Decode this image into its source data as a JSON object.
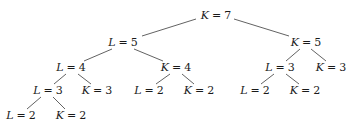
{
  "tree": {
    "nodes": [
      {
        "id": "n0",
        "var": "K",
        "value": "7",
        "x": 216,
        "y": 10
      },
      {
        "id": "n1",
        "var": "L",
        "value": "5",
        "x": 123,
        "y": 37
      },
      {
        "id": "n2",
        "var": "K",
        "value": "5",
        "x": 306,
        "y": 37
      },
      {
        "id": "n3",
        "var": "L",
        "value": "4",
        "x": 71,
        "y": 62
      },
      {
        "id": "n4",
        "var": "K",
        "value": "4",
        "x": 176,
        "y": 62
      },
      {
        "id": "n5",
        "var": "L",
        "value": "3",
        "x": 280,
        "y": 62
      },
      {
        "id": "n6",
        "var": "K",
        "value": "3",
        "x": 331,
        "y": 62
      },
      {
        "id": "n7",
        "var": "L",
        "value": "3",
        "x": 48,
        "y": 85
      },
      {
        "id": "n8",
        "var": "K",
        "value": "3",
        "x": 97,
        "y": 85
      },
      {
        "id": "n9",
        "var": "L",
        "value": "2",
        "x": 149,
        "y": 85
      },
      {
        "id": "n10",
        "var": "K",
        "value": "2",
        "x": 199,
        "y": 85
      },
      {
        "id": "n11",
        "var": "L",
        "value": "2",
        "x": 255,
        "y": 85
      },
      {
        "id": "n12",
        "var": "K",
        "value": "2",
        "x": 305,
        "y": 85
      },
      {
        "id": "n13",
        "var": "L",
        "value": "2",
        "x": 21,
        "y": 110
      },
      {
        "id": "n14",
        "var": "K",
        "value": "2",
        "x": 71,
        "y": 110
      }
    ],
    "edges": [
      {
        "x1": 196,
        "y1": 19,
        "x2": 142,
        "y2": 36
      },
      {
        "x1": 234,
        "y1": 19,
        "x2": 289,
        "y2": 36
      },
      {
        "x1": 112,
        "y1": 49,
        "x2": 84,
        "y2": 61
      },
      {
        "x1": 134,
        "y1": 49,
        "x2": 163,
        "y2": 61
      },
      {
        "x1": 300,
        "y1": 49,
        "x2": 286,
        "y2": 61
      },
      {
        "x1": 311,
        "y1": 49,
        "x2": 326,
        "y2": 61
      },
      {
        "x1": 66,
        "y1": 74,
        "x2": 54,
        "y2": 84
      },
      {
        "x1": 78,
        "y1": 74,
        "x2": 91,
        "y2": 84
      },
      {
        "x1": 170,
        "y1": 74,
        "x2": 156,
        "y2": 84
      },
      {
        "x1": 182,
        "y1": 74,
        "x2": 194,
        "y2": 84
      },
      {
        "x1": 274,
        "y1": 74,
        "x2": 261,
        "y2": 84
      },
      {
        "x1": 286,
        "y1": 74,
        "x2": 299,
        "y2": 84
      },
      {
        "x1": 41,
        "y1": 97,
        "x2": 27,
        "y2": 109
      },
      {
        "x1": 53,
        "y1": 97,
        "x2": 65,
        "y2": 109
      }
    ]
  }
}
